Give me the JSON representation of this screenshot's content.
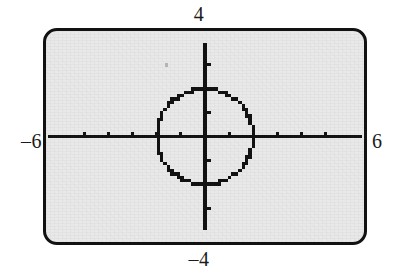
{
  "figure": {
    "kind": "graphing-calculator-screen",
    "screen_background": "#e9e9e9",
    "ink_color": "#121212",
    "paper_color": "#ffffff"
  },
  "labels": {
    "top": "4",
    "bottom": "–4",
    "left": "–6",
    "right": "6"
  },
  "chart_data": {
    "type": "scatter",
    "title": "",
    "subtitle": "",
    "xlabel": "",
    "ylabel": "",
    "xlim": [
      -6,
      6
    ],
    "ylim": [
      -4,
      4
    ],
    "grid": false,
    "legend": null,
    "axis_tick_step_x": 1,
    "axis_tick_step_y": 1,
    "x_tick_values": [
      -5,
      -4,
      -3,
      -2,
      -1,
      1,
      2,
      3,
      4,
      5
    ],
    "y_tick_values": [
      -3,
      -2,
      -1,
      1,
      2,
      3
    ],
    "tick_labels_visible": false,
    "corner_labels": {
      "xmin": "–6",
      "xmax": "6",
      "ymin": "–4",
      "ymax": "4"
    },
    "series": [
      {
        "name": "circle",
        "render": "dotted-pixels",
        "equation": "x^2 + y^2 = 4",
        "center": [
          0,
          0
        ],
        "radius": 2,
        "color": "#121212"
      }
    ],
    "annotations": []
  }
}
